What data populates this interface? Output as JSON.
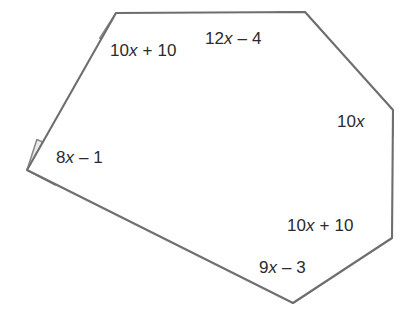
{
  "figure": {
    "type": "geometry-diagram",
    "shape_name": "hexagon",
    "background_color": "#ffffff",
    "stroke_color": "#6e6e6e",
    "arc_fill_color": "#ebebeb",
    "arc_stroke_color": "#8a8a8a",
    "label_color": "#2b2b2b",
    "vertices": [
      {
        "name": "top-left",
        "x": 116,
        "y": 13
      },
      {
        "name": "top-right",
        "x": 305,
        "y": 12
      },
      {
        "name": "right-upper",
        "x": 393,
        "y": 110
      },
      {
        "name": "right-lower",
        "x": 392,
        "y": 238
      },
      {
        "name": "bottom",
        "x": 293,
        "y": 303
      },
      {
        "name": "left",
        "x": 27,
        "y": 170
      }
    ],
    "angles": [
      {
        "id": "top-left",
        "label_text": "10x + 10",
        "label_parts": [
          "10",
          "x",
          " + 10"
        ],
        "label_x": 110,
        "label_y": 41,
        "vertex_x": 116,
        "vertex_y": 13,
        "arc_radius": 30,
        "arc_start_deg": 0,
        "arc_end_deg": 123
      },
      {
        "id": "top-right",
        "label_text": "12x – 4",
        "label_parts": [
          "12",
          "x",
          " – 4"
        ],
        "label_x": 205,
        "label_y": 29,
        "vertex_x": 305,
        "vertex_y": 12,
        "arc_radius": 28,
        "arc_start_deg": 48,
        "arc_end_deg": 180
      },
      {
        "id": "right-upper",
        "label_text": "10x",
        "label_parts": [
          "10",
          "x",
          ""
        ],
        "label_x": 337,
        "label_y": 112,
        "vertex_x": 393,
        "vertex_y": 110,
        "arc_radius": 26,
        "arc_start_deg": 90,
        "arc_end_deg": 228
      },
      {
        "id": "right-lower",
        "label_text": "10x + 10",
        "label_parts": [
          "10",
          "x",
          " + 10"
        ],
        "label_x": 287,
        "label_y": 216,
        "vertex_x": 392,
        "vertex_y": 238,
        "arc_radius": 28,
        "arc_start_deg": 147,
        "arc_end_deg": 270
      },
      {
        "id": "bottom",
        "label_text": "9x – 3",
        "label_parts": [
          "9",
          "x",
          " – 3"
        ],
        "label_x": 259,
        "label_y": 258,
        "vertex_x": 293,
        "vertex_y": 303,
        "arc_radius": 30,
        "arc_start_deg": 213,
        "arc_end_deg": 327
      },
      {
        "id": "left",
        "label_text": "8x – 1",
        "label_parts": [
          "8",
          "x",
          " – 1"
        ],
        "label_x": 56,
        "label_y": 148,
        "vertex_x": 27,
        "vertex_y": 170,
        "arc_radius": 32,
        "arc_start_deg": 288,
        "arc_end_deg": 28
      }
    ]
  }
}
